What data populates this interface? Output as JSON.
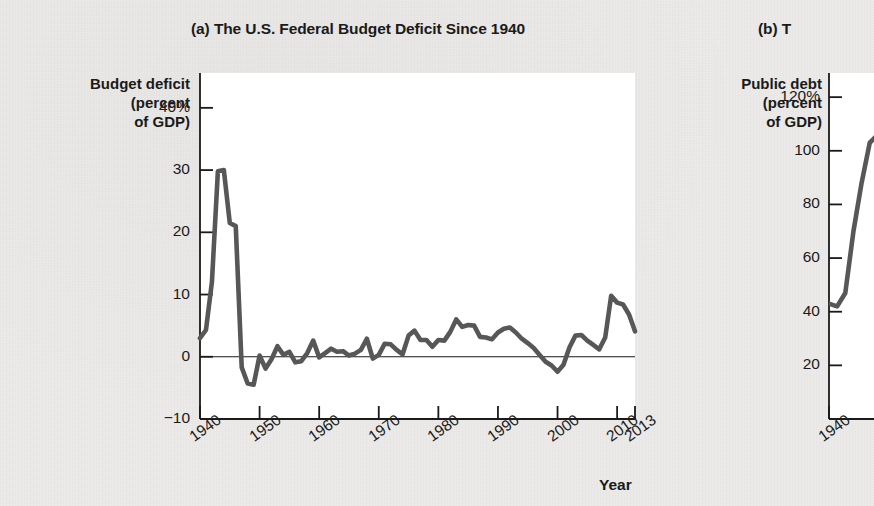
{
  "figure": {
    "panel_a_title": "(a) The U.S. Federal Budget Deficit Since 1940",
    "panel_b_title": "(b) T",
    "xaxis_name": "Year"
  },
  "chart_data": [
    {
      "type": "line",
      "panel": "a",
      "title": "(a) The U.S. Federal Budget Deficit Since 1940",
      "ylabel": "Budget deficit\n(percent\nof GDP)",
      "ylabel_lines": [
        "Budget deficit",
        "(percent",
        "of GDP)"
      ],
      "xlabel": "Year",
      "ylim": [
        -10,
        45
      ],
      "xlim": [
        1940,
        2013
      ],
      "ytick_labels": [
        "40%",
        "30",
        "20",
        "10",
        "0",
        "−10"
      ],
      "ytick_values": [
        40,
        30,
        20,
        10,
        0,
        -10
      ],
      "xtick_labels": [
        "1940",
        "1950",
        "1960",
        "1970",
        "1980",
        "1990",
        "2000",
        "2010",
        "2013"
      ],
      "xtick_values": [
        1940,
        1950,
        1960,
        1970,
        1980,
        1990,
        2000,
        2010,
        2013
      ],
      "grid": false,
      "zero_line": true,
      "legend": null,
      "line_color": "#575757",
      "x": [
        1940,
        1941,
        1942,
        1943,
        1944,
        1945,
        1946,
        1947,
        1948,
        1949,
        1950,
        1951,
        1952,
        1953,
        1954,
        1955,
        1956,
        1957,
        1958,
        1959,
        1960,
        1961,
        1962,
        1963,
        1964,
        1965,
        1966,
        1967,
        1968,
        1969,
        1970,
        1971,
        1972,
        1973,
        1974,
        1975,
        1976,
        1977,
        1978,
        1979,
        1980,
        1981,
        1982,
        1983,
        1984,
        1985,
        1986,
        1987,
        1988,
        1989,
        1990,
        1991,
        1992,
        1993,
        1994,
        1995,
        1996,
        1997,
        1998,
        1999,
        2000,
        2001,
        2002,
        2003,
        2004,
        2005,
        2006,
        2007,
        2008,
        2009,
        2010,
        2011,
        2012,
        2013
      ],
      "values": [
        3.0,
        4.3,
        12.0,
        29.8,
        30.0,
        21.5,
        21.0,
        -1.7,
        -4.3,
        -4.5,
        0.2,
        -1.9,
        -0.4,
        1.7,
        0.3,
        0.8,
        -0.9,
        -0.7,
        0.6,
        2.6,
        -0.1,
        0.6,
        1.3,
        0.8,
        0.9,
        0.2,
        0.5,
        1.1,
        2.9,
        -0.3,
        0.3,
        2.1,
        2.0,
        1.1,
        0.4,
        3.4,
        4.2,
        2.7,
        2.7,
        1.6,
        2.7,
        2.6,
        4.0,
        6.0,
        4.8,
        5.1,
        5.0,
        3.2,
        3.1,
        2.8,
        3.9,
        4.5,
        4.7,
        3.9,
        2.9,
        2.2,
        1.4,
        0.3,
        -0.8,
        -1.4,
        -2.4,
        -1.3,
        1.5,
        3.4,
        3.5,
        2.6,
        1.9,
        1.2,
        3.1,
        9.8,
        8.7,
        8.4,
        6.8,
        4.1
      ]
    },
    {
      "type": "line",
      "panel": "b",
      "title": "(b) T",
      "ylabel": "Public debt\n(percent\nof GDP)",
      "ylabel_lines": [
        "Public debt",
        "(percent",
        "of GDP)"
      ],
      "xlabel": "Year",
      "ylim": [
        0,
        130
      ],
      "xlim": [
        1940,
        2013
      ],
      "ytick_labels": [
        "120%",
        "100",
        "80",
        "60",
        "40",
        "20"
      ],
      "ytick_values": [
        120,
        100,
        80,
        60,
        40,
        20
      ],
      "xtick_labels": [
        "1940"
      ],
      "xtick_values": [
        1940
      ],
      "grid": false,
      "legend": null,
      "line_color": "#575757",
      "x": [
        1940,
        1941,
        1942,
        1943,
        1944,
        1945,
        1946,
        1947,
        1948,
        1949
      ],
      "values": [
        43.0,
        42.0,
        47.0,
        70.0,
        88.0,
        103.0,
        106.0,
        98.0,
        92.0,
        88.0
      ],
      "note": "panel (b) is clipped at the right edge of the screenshot"
    }
  ],
  "panel_a": {
    "ylabel_lines": [
      "Budget deficit",
      "(percent",
      "of GDP)"
    ],
    "ytick_labels": [
      "40%",
      "30",
      "20",
      "10",
      "0",
      "−10"
    ],
    "xtick_labels": [
      "1940",
      "1950",
      "1960",
      "1970",
      "1980",
      "1990",
      "2000",
      "2010",
      "2013"
    ]
  },
  "panel_b": {
    "ylabel_lines": [
      "Public debt",
      "(percent",
      "of GDP)"
    ],
    "ytick_labels": [
      "120%",
      "100",
      "80",
      "60",
      "40",
      "20"
    ],
    "xtick_labels": [
      "1940"
    ]
  }
}
